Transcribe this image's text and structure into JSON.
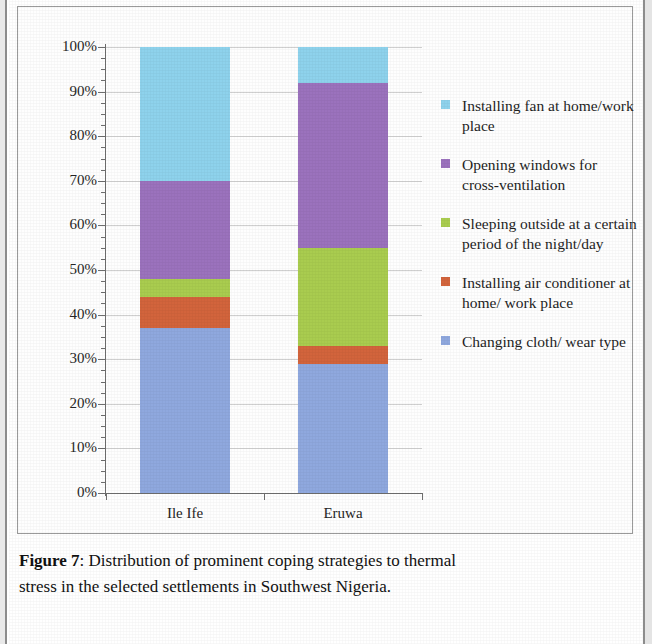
{
  "chart_data": {
    "type": "bar",
    "subtype": "stacked-percentage-column",
    "title": "",
    "xlabel": "",
    "ylabel": "",
    "categories": [
      "Ile Ife",
      "Eruwa"
    ],
    "ylim": [
      0,
      100
    ],
    "ytick_labels": [
      "0%",
      "10%",
      "20%",
      "30%",
      "40%",
      "50%",
      "60%",
      "70%",
      "80%",
      "90%",
      "100%"
    ],
    "ytick_values": [
      0,
      10,
      20,
      30,
      40,
      50,
      60,
      70,
      80,
      90,
      100
    ],
    "grid": true,
    "legend_position": "right",
    "stack_order_bottom_to_top": [
      "Changing cloth/ wear type",
      "Installing air conditioner at home/ work place",
      "Sleeping outside at a certain period of the night/day",
      "Opening windows for cross-ventilation",
      "Installing fan at home/work place"
    ],
    "series": [
      {
        "name": "Changing cloth/ wear type",
        "color": "#8fa8de",
        "values": [
          37,
          29
        ]
      },
      {
        "name": "Installing air conditioner at home/ work place",
        "color": "#d2643c",
        "values": [
          7,
          4
        ]
      },
      {
        "name": "Sleeping outside at a certain period of the night/day",
        "color": "#a9cc4f",
        "values": [
          4,
          22
        ]
      },
      {
        "name": "Opening windows for cross-ventilation",
        "color": "#9b72bd",
        "values": [
          22,
          37
        ]
      },
      {
        "name": "Installing fan at home/work place",
        "color": "#8ed2ec",
        "values": [
          30,
          8
        ]
      }
    ]
  },
  "legend": {
    "entries": [
      {
        "label": "Installing fan at home/work place",
        "color": "#8ed2ec"
      },
      {
        "label": "Opening windows for cross-ventilation",
        "color": "#9b72bd"
      },
      {
        "label": "Sleeping outside at a certain period of the night/day",
        "color": "#a9cc4f"
      },
      {
        "label": "Installing air conditioner at home/ work place",
        "color": "#d2643c"
      },
      {
        "label": "Changing cloth/ wear type",
        "color": "#8fa8de"
      }
    ]
  },
  "caption": {
    "figure_label": "Figure 7",
    "separator": ":",
    "line1": "Distribution of prominent coping strategies to thermal",
    "line2": "stress in the selected settlements in Southwest Nigeria."
  }
}
